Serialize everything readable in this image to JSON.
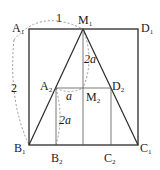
{
  "diagram": {
    "points": {
      "A1": {
        "label": "A",
        "sub": "1"
      },
      "D1": {
        "label": "D",
        "sub": "1"
      },
      "M1": {
        "label": "M",
        "sub": "1"
      },
      "B1": {
        "label": "B",
        "sub": "1"
      },
      "C1": {
        "label": "C",
        "sub": "1"
      },
      "A2": {
        "label": "A",
        "sub": "2"
      },
      "D2": {
        "label": "D",
        "sub": "2"
      },
      "M2": {
        "label": "M",
        "sub": "2"
      },
      "B2": {
        "label": "B",
        "sub": "2"
      },
      "C2": {
        "label": "C",
        "sub": "2"
      }
    },
    "measures": {
      "top_arc": "1",
      "left_arc": "2",
      "upper_center": "2a",
      "mid_small": "a",
      "lower_left": "2a"
    },
    "colors": {
      "line": "#2a2a2a",
      "thin": "#555555",
      "dashed": "#9a9a9a"
    }
  }
}
